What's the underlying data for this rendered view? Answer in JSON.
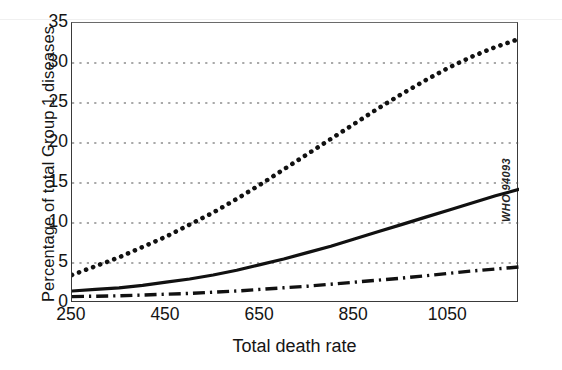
{
  "credit": {
    "text": "WHO 94093"
  },
  "chart_data": {
    "type": "line",
    "title": "",
    "xlabel": "Total death rate",
    "ylabel": "Percentage of total Group 1 diseases",
    "xlim": [
      250,
      1200
    ],
    "ylim": [
      0,
      35
    ],
    "xticks": [
      250,
      450,
      650,
      850,
      1050
    ],
    "yticks": [
      0,
      5,
      10,
      15,
      20,
      25,
      30,
      35
    ],
    "grid": {
      "horizontal": true,
      "vertical": false,
      "style": "dotted",
      "at": [
        5,
        10,
        15,
        20,
        25,
        30
      ]
    },
    "legend": {
      "position": "none"
    },
    "x": [
      250,
      300,
      350,
      400,
      450,
      500,
      550,
      600,
      650,
      700,
      750,
      800,
      850,
      900,
      950,
      1000,
      1050,
      1100,
      1150,
      1200
    ],
    "series": [
      {
        "name": "dotted-series",
        "style": "dotted",
        "values": [
          3.5,
          4.6,
          5.7,
          7.0,
          8.3,
          9.8,
          11.3,
          13.0,
          14.8,
          16.7,
          18.6,
          20.5,
          22.4,
          24.3,
          26.1,
          27.8,
          29.4,
          30.8,
          32.0,
          33.0
        ]
      },
      {
        "name": "solid-series",
        "style": "solid",
        "values": [
          1.5,
          1.7,
          1.9,
          2.2,
          2.6,
          3.0,
          3.5,
          4.1,
          4.8,
          5.5,
          6.3,
          7.1,
          8.0,
          8.9,
          9.8,
          10.7,
          11.6,
          12.5,
          13.4,
          14.2
        ]
      },
      {
        "name": "dash-dot-series",
        "style": "dash-dot",
        "values": [
          0.8,
          0.85,
          0.9,
          1.0,
          1.1,
          1.2,
          1.35,
          1.5,
          1.7,
          1.9,
          2.1,
          2.35,
          2.6,
          2.85,
          3.1,
          3.4,
          3.7,
          4.0,
          4.25,
          4.5
        ]
      }
    ]
  }
}
